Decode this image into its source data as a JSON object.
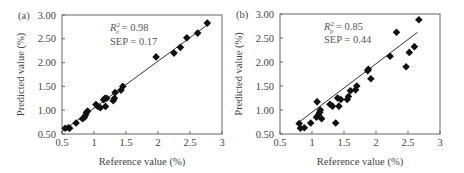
{
  "chart_data": [
    {
      "type": "scatter",
      "panel_label": "(a)",
      "xlabel": "Reference value (%)",
      "ylabel": "Predicted value (%)",
      "xlim": [
        0.5,
        3
      ],
      "ylim": [
        0.5,
        3.0
      ],
      "xticks": [
        "0.5",
        "1",
        "1.5",
        "2",
        "2.5",
        "3"
      ],
      "yticks": [
        "0.50",
        "1.00",
        "1.50",
        "2.00",
        "2.50",
        "3.00"
      ],
      "grid": false,
      "annotations": {
        "r2_label": "R",
        "r2_sup": "2",
        "r2_sub": "c",
        "r2_value": " = 0.98",
        "sep": "SEP = 0.17"
      },
      "fit_line": {
        "x": [
          0.5,
          2.8
        ],
        "y": [
          0.55,
          2.82
        ]
      },
      "marker": "diamond",
      "points": [
        [
          0.55,
          0.62
        ],
        [
          0.6,
          0.63
        ],
        [
          0.62,
          0.62
        ],
        [
          0.72,
          0.73
        ],
        [
          0.82,
          0.82
        ],
        [
          0.85,
          0.85
        ],
        [
          0.87,
          0.9
        ],
        [
          0.88,
          0.95
        ],
        [
          0.9,
          0.98
        ],
        [
          1.03,
          1.12
        ],
        [
          1.06,
          1.08
        ],
        [
          1.1,
          1.05
        ],
        [
          1.15,
          1.22
        ],
        [
          1.17,
          1.25
        ],
        [
          1.18,
          1.08
        ],
        [
          1.2,
          1.25
        ],
        [
          1.3,
          1.2
        ],
        [
          1.32,
          1.25
        ],
        [
          1.33,
          1.37
        ],
        [
          1.42,
          1.42
        ],
        [
          1.45,
          1.5
        ],
        [
          1.97,
          2.12
        ],
        [
          2.25,
          2.2
        ],
        [
          2.35,
          2.32
        ],
        [
          2.45,
          2.52
        ],
        [
          2.62,
          2.62
        ],
        [
          2.77,
          2.83
        ]
      ]
    },
    {
      "type": "scatter",
      "panel_label": "(b)",
      "xlabel": "Reference value (%)",
      "ylabel": "Predicted value (%)",
      "xlim": [
        0.5,
        3
      ],
      "ylim": [
        0.5,
        3.0
      ],
      "xticks": [
        "0.5",
        "1",
        "1.5",
        "2",
        "2.5",
        "3"
      ],
      "yticks": [
        "0.50",
        "1.00",
        "1.50",
        "2.00",
        "2.50",
        "3.00"
      ],
      "grid": false,
      "annotations": {
        "r2_label": "R",
        "r2_sup": "2",
        "r2_sub": "p",
        "r2_value": " = 0.85",
        "sep": "SEP = 0.44"
      },
      "fit_line": {
        "x": [
          0.75,
          2.65
        ],
        "y": [
          0.7,
          2.62
        ]
      },
      "marker": "diamond",
      "points": [
        [
          0.8,
          0.72
        ],
        [
          0.82,
          0.62
        ],
        [
          0.88,
          0.63
        ],
        [
          0.98,
          0.73
        ],
        [
          1.07,
          0.85
        ],
        [
          1.08,
          1.17
        ],
        [
          1.1,
          0.9
        ],
        [
          1.12,
          0.95
        ],
        [
          1.13,
          1.0
        ],
        [
          1.15,
          0.82
        ],
        [
          1.28,
          1.12
        ],
        [
          1.32,
          1.08
        ],
        [
          1.37,
          0.73
        ],
        [
          1.4,
          1.25
        ],
        [
          1.42,
          1.08
        ],
        [
          1.45,
          1.22
        ],
        [
          1.55,
          1.22
        ],
        [
          1.57,
          1.28
        ],
        [
          1.6,
          1.4
        ],
        [
          1.68,
          1.42
        ],
        [
          1.7,
          1.5
        ],
        [
          1.87,
          1.82
        ],
        [
          1.88,
          1.85
        ],
        [
          1.92,
          1.65
        ],
        [
          2.22,
          2.12
        ],
        [
          2.32,
          2.62
        ],
        [
          2.47,
          1.9
        ],
        [
          2.52,
          2.2
        ],
        [
          2.6,
          2.32
        ],
        [
          2.67,
          2.88
        ]
      ]
    }
  ]
}
